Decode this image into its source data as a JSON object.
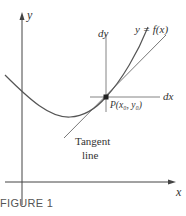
{
  "figure": {
    "caption": "FIGURE 1",
    "axis_labels": {
      "x": "x",
      "y": "y"
    },
    "curve_label": "y = f(x)",
    "dy_label": "dy",
    "dx_label": "dx",
    "point_label": "P(x₀, y₀)",
    "tangent_label_line1": "Tangent",
    "tangent_label_line2": "line",
    "colors": {
      "curve": "#555555",
      "axes": "#444444",
      "point": "#222222"
    }
  }
}
